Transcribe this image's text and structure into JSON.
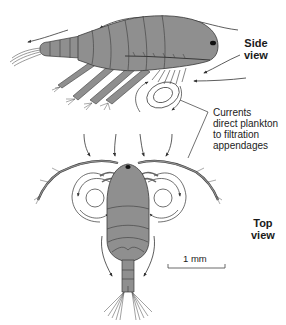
{
  "figure": {
    "labels": {
      "side_view": [
        "Side",
        "view"
      ],
      "top_view": [
        "Top",
        "view"
      ],
      "callout": [
        "Currents",
        "direct plankton",
        "to filtration",
        "appendages"
      ],
      "scale_bar": "1 mm"
    },
    "colors": {
      "body_fill": "#8f8f8f",
      "body_stroke": "#3a3a3a",
      "arrow": "#333333",
      "eye": "#111111",
      "background": "#ffffff"
    }
  }
}
